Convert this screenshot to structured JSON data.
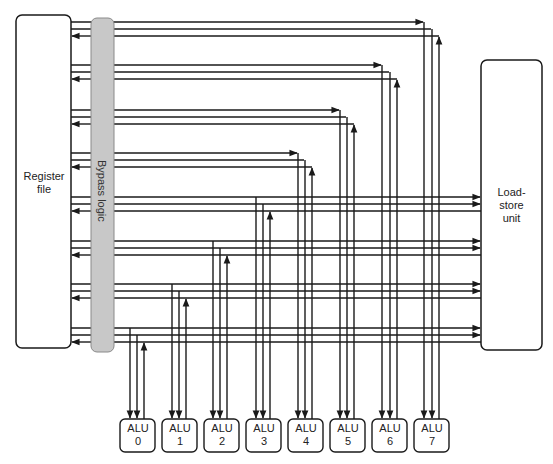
{
  "diagram": {
    "register_file": {
      "label_line1": "Register",
      "label_line2": "file"
    },
    "bypass_logic": {
      "label": "Bypass logic",
      "fill": "#c8c8c8"
    },
    "load_store_unit": {
      "label_line1": "Load-",
      "label_line2": "store",
      "label_line3": "unit"
    },
    "alus": [
      {
        "title": "ALU",
        "index": "0"
      },
      {
        "title": "ALU",
        "index": "1"
      },
      {
        "title": "ALU",
        "index": "2"
      },
      {
        "title": "ALU",
        "index": "3"
      },
      {
        "title": "ALU",
        "index": "4"
      },
      {
        "title": "ALU",
        "index": "5"
      },
      {
        "title": "ALU",
        "index": "6"
      },
      {
        "title": "ALU",
        "index": "7"
      }
    ],
    "line_color": "#1a1a1a",
    "buses": [
      {
        "alu": 7,
        "y": [
          22,
          29,
          36
        ],
        "x": [
          424,
          432,
          439
        ],
        "lsu": false
      },
      {
        "alu": 6,
        "y": [
          65,
          72,
          79
        ],
        "x": [
          382,
          390,
          397
        ],
        "lsu": false
      },
      {
        "alu": 5,
        "y": [
          110,
          117,
          124
        ],
        "x": [
          340,
          347,
          354
        ],
        "lsu": false
      },
      {
        "alu": 4,
        "y": [
          153,
          160,
          167
        ],
        "x": [
          298,
          305,
          312
        ],
        "lsu": false
      },
      {
        "alu": 3,
        "y": [
          197,
          204,
          211
        ],
        "x": [
          256,
          263,
          270
        ],
        "lsu": true
      },
      {
        "alu": 2,
        "y": [
          241,
          248,
          255
        ],
        "x": [
          213,
          220,
          227
        ],
        "lsu": true
      },
      {
        "alu": 1,
        "y": [
          284,
          291,
          298
        ],
        "x": [
          172,
          179,
          186
        ],
        "lsu": true
      },
      {
        "alu": 0,
        "y": [
          328,
          335,
          342
        ],
        "x": [
          130,
          137,
          144
        ],
        "lsu": true
      }
    ]
  }
}
